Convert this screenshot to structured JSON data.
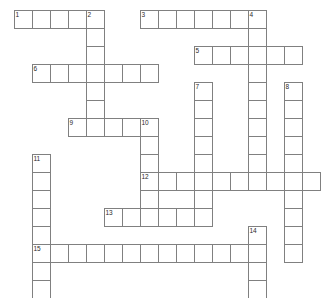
{
  "puzzle": {
    "title": "Crossword Puzzle Grid",
    "type": "crossword",
    "cell_size_px": 18,
    "origin_x_px": 14,
    "origin_y_px": 10,
    "columns": 17,
    "rows": 15,
    "cell_fill_color": "#ffffff",
    "cell_border_color": "#808080",
    "background_color": "#ffffff",
    "clue_number_color": "#2b2b2b"
  },
  "entries": [
    {
      "number": "1",
      "direction": "across",
      "row": 0,
      "col": 0,
      "length": 5
    },
    {
      "number": "2",
      "direction": "down",
      "row": 0,
      "col": 4,
      "length": 7
    },
    {
      "number": "3",
      "direction": "across",
      "row": 0,
      "col": 7,
      "length": 7
    },
    {
      "number": "4",
      "direction": "down",
      "row": 0,
      "col": 13,
      "length": 10
    },
    {
      "number": "5",
      "direction": "across",
      "row": 2,
      "col": 10,
      "length": 6
    },
    {
      "number": "6",
      "direction": "across",
      "row": 3,
      "col": 1,
      "length": 7
    },
    {
      "number": "7",
      "direction": "down",
      "row": 4,
      "col": 10,
      "length": 7
    },
    {
      "number": "8",
      "direction": "down",
      "row": 4,
      "col": 15,
      "length": 10
    },
    {
      "number": "9",
      "direction": "across",
      "row": 6,
      "col": 3,
      "length": 5
    },
    {
      "number": "10",
      "direction": "down",
      "row": 6,
      "col": 7,
      "length": 6
    },
    {
      "number": "11",
      "direction": "down",
      "row": 8,
      "col": 1,
      "length": 8
    },
    {
      "number": "12",
      "direction": "across",
      "row": 9,
      "col": 7,
      "length": 10
    },
    {
      "number": "13",
      "direction": "across",
      "row": 11,
      "col": 5,
      "length": 6
    },
    {
      "number": "14",
      "direction": "down",
      "row": 12,
      "col": 13,
      "length": 4
    },
    {
      "number": "15",
      "direction": "across",
      "row": 13,
      "col": 1,
      "length": 12
    }
  ],
  "clue_numbers": [
    {
      "label": "1",
      "row": 0,
      "col": 0
    },
    {
      "label": "2",
      "row": 0,
      "col": 4
    },
    {
      "label": "3",
      "row": 0,
      "col": 7
    },
    {
      "label": "4",
      "row": 0,
      "col": 13
    },
    {
      "label": "5",
      "row": 2,
      "col": 10
    },
    {
      "label": "6",
      "row": 3,
      "col": 1
    },
    {
      "label": "7",
      "row": 4,
      "col": 10
    },
    {
      "label": "8",
      "row": 4,
      "col": 15
    },
    {
      "label": "9",
      "row": 6,
      "col": 3
    },
    {
      "label": "10",
      "row": 6,
      "col": 7
    },
    {
      "label": "11",
      "row": 8,
      "col": 1
    },
    {
      "label": "12",
      "row": 9,
      "col": 7
    },
    {
      "label": "13",
      "row": 11,
      "col": 5
    },
    {
      "label": "14",
      "row": 12,
      "col": 13
    },
    {
      "label": "15",
      "row": 13,
      "col": 1
    }
  ],
  "letters": {}
}
